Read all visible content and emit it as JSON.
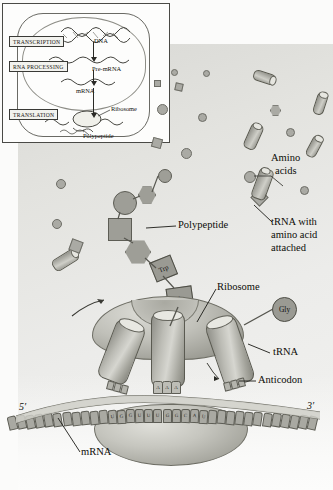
{
  "figure": {
    "background_color": "#e6e6e2",
    "accent_color": "#9e9e97"
  },
  "inset": {
    "steps": [
      {
        "id": "transcription",
        "label": "TRANSCRIPTION"
      },
      {
        "id": "rna_processing",
        "label": "RNA PROCESSING"
      },
      {
        "id": "translation",
        "label": "TRANSLATION"
      }
    ],
    "molecules": [
      {
        "id": "dna",
        "label": "DNA"
      },
      {
        "id": "pre_mrna",
        "label": "Pre-mRNA"
      },
      {
        "id": "mrna",
        "label": "mRNA"
      },
      {
        "id": "ribosome",
        "label": "Ribosome"
      },
      {
        "id": "polypeptide",
        "label": "Polypeptide"
      }
    ]
  },
  "labels": {
    "amino_acids": "Amino\nacids",
    "amino_acids_line1": "Amino",
    "amino_acids_line2": "acids",
    "trna_with_aa_line1": "tRNA with",
    "trna_with_aa_line2": "amino acid",
    "trna_with_aa_line3": "attached",
    "polypeptide": "Polypeptide",
    "ribosome": "Ribosome",
    "trna": "tRNA",
    "anticodon": "Anticodon",
    "mrna": "mRNA",
    "five_prime": "5′",
    "three_prime": "3′"
  },
  "amino_acid_tags": [
    {
      "id": "trp",
      "label": "Trp",
      "shape": "square"
    },
    {
      "id": "phe",
      "label": "Phe",
      "shape": "square"
    },
    {
      "id": "gly",
      "label": "Gly",
      "shape": "circle"
    }
  ],
  "chart_data": {
    "type": "diagram",
    "mrna_codons": [
      "U",
      "G",
      "G",
      "U",
      "U",
      "U",
      "G",
      "G",
      "C",
      "A",
      "U"
    ],
    "anticodon_displayed": [
      "A",
      "A",
      "A"
    ],
    "codon_under_anticodon": [
      "U",
      "U",
      "U"
    ],
    "trna_sites": [
      "E",
      "P",
      "A"
    ],
    "polypeptide_residues": [
      "circle",
      "hexagon",
      "circle",
      "square",
      "hexagon",
      "square",
      "Trp",
      "Phe"
    ]
  }
}
